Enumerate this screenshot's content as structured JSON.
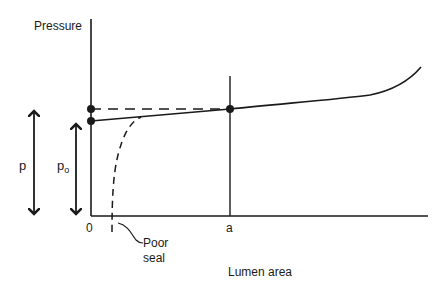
{
  "diagram": {
    "y_axis_label": "Pressure",
    "x_axis_label": "Lumen area",
    "x_ticks": {
      "origin": "0",
      "a": "a"
    },
    "pressure_symbols": {
      "p": "p",
      "p0_base": "p",
      "p0_sub": "o"
    },
    "annotation": {
      "line1": "Poor",
      "line2": "seal"
    },
    "colors": {
      "ink": "#1a1a1a",
      "background": "#ffffff"
    },
    "elements": [
      "pressure-lumen-area curve (solid, rising steeply at large area)",
      "dashed horizontal line at pressure p to point a",
      "dashed poor-seal curve rising from near zero area to meet the main curve",
      "double-headed arrow p",
      "double-headed arrow p0"
    ]
  }
}
